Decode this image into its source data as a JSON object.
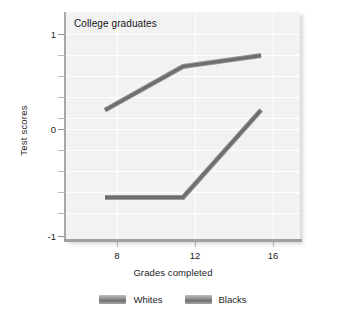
{
  "chart_data": {
    "type": "line",
    "title": "College graduates",
    "xlabel": "Grades completed",
    "ylabel": "Test scores",
    "x": [
      8,
      12,
      16
    ],
    "xticklabels": [
      "8",
      "12",
      "16"
    ],
    "yticklabels": [
      "1",
      "0",
      "-1"
    ],
    "ytickvalues": [
      1,
      0,
      -1
    ],
    "xlim": [
      6,
      18
    ],
    "ylim": [
      -1,
      1.1
    ],
    "grid": true,
    "legend_position": "bottom-center",
    "series": [
      {
        "name": "Whites",
        "values": [
          0.2,
          0.6,
          0.7
        ],
        "color": "#6e6e6e"
      },
      {
        "name": "Blacks",
        "values": [
          -0.6,
          -0.6,
          0.2
        ],
        "color": "#6e6e6e"
      }
    ],
    "minor_gridline_step": 0.2,
    "background": "#f2f2f2",
    "gridline_color": "#ffffff"
  }
}
